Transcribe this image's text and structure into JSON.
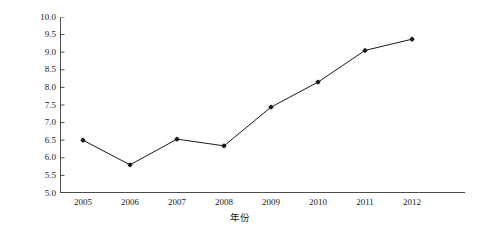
{
  "chart_data": {
    "type": "line",
    "title": "",
    "xlabel": "年份",
    "ylabel": "广东木材产量占全国木材产量的比例(%)",
    "categories": [
      "2005",
      "2006",
      "2007",
      "2008",
      "2009",
      "2010",
      "2011",
      "2012"
    ],
    "values": [
      6.5,
      5.8,
      6.53,
      6.34,
      7.44,
      8.15,
      9.05,
      9.37
    ],
    "series": [
      {
        "name": "广东木材产量占全国木材产量的比例",
        "values": [
          6.5,
          5.8,
          6.53,
          6.34,
          7.44,
          8.15,
          9.05,
          9.37
        ]
      }
    ],
    "ylim": [
      5.0,
      10.0
    ],
    "ytick_step": 0.5,
    "yticks": [
      "10.0",
      "9.5",
      "9.0",
      "8.5",
      "8.0",
      "7.5",
      "7.0",
      "6.5",
      "6.0",
      "5.5",
      "5.0"
    ],
    "ytick_values": [
      10.0,
      9.5,
      9.0,
      8.5,
      8.0,
      7.5,
      7.0,
      6.5,
      6.0,
      5.5,
      5.0
    ],
    "xticks": [
      "2005",
      "2006",
      "2007",
      "2008",
      "2009",
      "2010",
      "2011",
      "2012"
    ],
    "grid": false,
    "legend": false,
    "legend_position": "none",
    "marker": "diamond",
    "line_color": "#1a1a1a",
    "marker_color": "#1a1a1a",
    "background_color": "#ffffff",
    "axis_color": "#4d4d4d"
  }
}
